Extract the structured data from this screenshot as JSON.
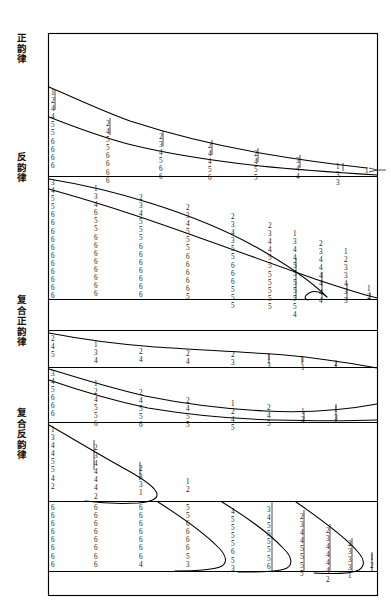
{
  "figure": {
    "title": "",
    "background": "#ffffff",
    "ink": "#000000",
    "panels": [
      {
        "id": "panel-1",
        "label": "正韵律",
        "columns": [
          {
            "x": 55,
            "digits": [
              "1",
              "2",
              "4",
              "4",
              "5",
              "5",
              "6",
              "6",
              "6",
              "6"
            ]
          },
          {
            "x": 110,
            "digits": [
              "2",
              "4",
              "5",
              "5",
              "6",
              "6",
              "6",
              "6"
            ]
          },
          {
            "x": 163,
            "digits": [
              "2",
              "3",
              "4",
              "5",
              "6",
              "6"
            ]
          },
          {
            "x": 212,
            "digits": [
              "2",
              "4",
              "4",
              "5",
              "6"
            ]
          },
          {
            "x": 258,
            "digits": [
              "2",
              "4",
              "5",
              "5"
            ]
          },
          {
            "x": 300,
            "digits": [
              "3",
              "4",
              "4"
            ]
          },
          {
            "x": 340,
            "digits": [
              "1",
              "3",
              "3"
            ]
          },
          {
            "x": 368,
            "digits": [
              "1"
            ]
          }
        ]
      },
      {
        "id": "panel-2",
        "label": "反韵律",
        "columns": [
          {
            "x": 55,
            "digits": [
              "3",
              "4",
              "5",
              "5",
              "6",
              "6",
              "6",
              "6",
              "6",
              "6",
              "6",
              "6",
              "6",
              "6",
              "6"
            ]
          },
          {
            "x": 98,
            "digits": [
              "1",
              "3",
              "4",
              "6",
              "5",
              "5",
              "6",
              "6",
              "6",
              "6",
              "6",
              "6",
              "6",
              "6"
            ]
          },
          {
            "x": 143,
            "digits": [
              "2",
              "3",
              "4",
              "5",
              "5",
              "5",
              "6",
              "6",
              "6",
              "6",
              "6",
              "6",
              "6"
            ]
          },
          {
            "x": 190,
            "digits": [
              "2",
              "3",
              "4",
              "5",
              "5",
              "5",
              "6",
              "6",
              "6",
              "6",
              "6",
              "5"
            ]
          },
          {
            "x": 235,
            "digits": [
              "2",
              "3",
              "4",
              "3",
              "5",
              "5",
              "6",
              "6",
              "6",
              "5",
              "5",
              "5"
            ]
          },
          {
            "x": 272,
            "digits": [
              "2",
              "3",
              "4",
              "4",
              "5",
              "5",
              "5",
              "5",
              "5",
              "5",
              "5"
            ]
          },
          {
            "x": 300,
            "digits": [
              "1",
              "3",
              "4",
              "4",
              "5",
              "5",
              "5",
              "5",
              "5",
              "5",
              "4"
            ]
          },
          {
            "x": 327,
            "digits": [
              "2",
              "3",
              "4",
              "4",
              "4",
              "4",
              "4",
              "4"
            ]
          },
          {
            "x": 348,
            "digits": [
              "1",
              "2",
              "3",
              "3",
              "4",
              "3",
              "3"
            ]
          },
          {
            "x": 371,
            "digits": [
              "1",
              "2"
            ]
          }
        ]
      },
      {
        "id": "panel-3",
        "label": "复合正韵律",
        "columns": [
          {
            "x": 55,
            "digits": [
              "2",
              "4",
              "5"
            ]
          },
          {
            "x": 98,
            "digits": [
              "1",
              "3",
              "4"
            ]
          },
          {
            "x": 143,
            "digits": [
              "2",
              "4"
            ]
          },
          {
            "x": 190,
            "digits": [
              "2",
              "4"
            ]
          },
          {
            "x": 235,
            "digits": [
              "2",
              "3"
            ]
          },
          {
            "x": 272,
            "digits": [
              "1",
              "3"
            ]
          },
          {
            "x": 305,
            "digits": [
              "1",
              "1"
            ]
          },
          {
            "x": 338,
            "digits": [
              "2"
            ]
          }
        ]
      },
      {
        "id": "panel-4",
        "label": "",
        "columns": [
          {
            "x": 55,
            "digits": [
              "3",
              "4",
              "5",
              "6",
              "6",
              "6"
            ]
          },
          {
            "x": 98,
            "digits": [
              "1",
              "2",
              "4",
              "5",
              "5",
              "6"
            ]
          },
          {
            "x": 143,
            "digits": [
              "2",
              "4",
              "5",
              "5",
              "6"
            ]
          },
          {
            "x": 190,
            "digits": [
              "2",
              "4",
              "5",
              "5"
            ]
          },
          {
            "x": 235,
            "digits": [
              "1",
              "2",
              "4",
              "5"
            ]
          },
          {
            "x": 272,
            "digits": [
              "2",
              "4",
              "5"
            ]
          },
          {
            "x": 305,
            "digits": [
              "1",
              "3"
            ]
          },
          {
            "x": 338,
            "digits": [
              "1",
              "3"
            ]
          }
        ]
      },
      {
        "id": "panel-5",
        "label": "复合反韵律",
        "columns": [
          {
            "x": 55,
            "digits": [
              "1",
              "3",
              "4",
              "4",
              "5",
              "5",
              "4",
              "2"
            ]
          },
          {
            "x": 98,
            "digits": [
              "2",
              "3",
              "4",
              "4",
              "4",
              "4",
              "2"
            ]
          },
          {
            "x": 143,
            "digits": [
              "2",
              "3",
              "3",
              "1"
            ]
          },
          {
            "x": 190,
            "digits": [
              "1",
              "2"
            ]
          }
        ]
      },
      {
        "id": "panel-6",
        "label": "",
        "columns": [
          {
            "x": 55,
            "digits": [
              "6",
              "6",
              "6",
              "6",
              "6",
              "6",
              "6",
              "6"
            ]
          },
          {
            "x": 98,
            "digits": [
              "6",
              "6",
              "6",
              "6",
              "6",
              "6",
              "6",
              "6"
            ]
          },
          {
            "x": 143,
            "digits": [
              "6",
              "6",
              "6",
              "6",
              "6",
              "6",
              "6",
              "4"
            ]
          },
          {
            "x": 190,
            "digits": [
              "5",
              "5",
              "6",
              "6",
              "6",
              "6",
              "5",
              "3"
            ]
          },
          {
            "x": 235,
            "digits": [
              "4",
              "5",
              "5",
              "5",
              "5",
              "6",
              "5",
              "3"
            ]
          },
          {
            "x": 272,
            "digits": [
              "3",
              "4",
              "5",
              "5",
              "5",
              "5",
              "5",
              "6"
            ]
          },
          {
            "x": 305,
            "digits": [
              "2",
              "3",
              "4",
              "4",
              "5",
              "5",
              "5",
              "5"
            ]
          },
          {
            "x": 330,
            "digits": [
              "2",
              "3",
              "4",
              "4",
              "4",
              "4",
              "2"
            ]
          },
          {
            "x": 352,
            "digits": [
              "2",
              "3",
              "3",
              "3",
              "1"
            ]
          },
          {
            "x": 374,
            "digits": [
              "1",
              "2"
            ]
          }
        ]
      }
    ]
  },
  "chart_data": {
    "type": "line",
    "xlabel": "",
    "ylabel": "",
    "grid": false,
    "legend_position": "left-outside",
    "series": [
      {
        "name": "正韵律-上曲线",
        "panel": "panel-1",
        "points": [
          [
            48,
            87
          ],
          [
            80,
            103
          ],
          [
            120,
            118
          ],
          [
            160,
            130
          ],
          [
            200,
            139
          ],
          [
            240,
            147
          ],
          [
            280,
            153
          ],
          [
            320,
            160
          ],
          [
            355,
            166
          ],
          [
            375,
            168
          ]
        ]
      },
      {
        "name": "正韵律-下曲线",
        "panel": "panel-1",
        "points": [
          [
            48,
            117
          ],
          [
            80,
            131
          ],
          [
            120,
            145
          ],
          [
            160,
            153
          ],
          [
            200,
            160
          ],
          [
            240,
            165
          ],
          [
            280,
            169
          ],
          [
            320,
            172
          ],
          [
            355,
            174
          ],
          [
            378,
            175
          ]
        ]
      },
      {
        "name": "反韵律-上曲线",
        "panel": "panel-2",
        "points": [
          [
            48,
            180
          ],
          [
            90,
            188
          ],
          [
            130,
            197
          ],
          [
            180,
            210
          ],
          [
            230,
            225
          ],
          [
            270,
            240
          ],
          [
            300,
            258
          ],
          [
            322,
            278
          ],
          [
            335,
            295
          ]
        ]
      },
      {
        "name": "反韵律-下曲线",
        "panel": "panel-2",
        "points": [
          [
            48,
            190
          ],
          [
            90,
            203
          ],
          [
            140,
            220
          ],
          [
            190,
            238
          ],
          [
            240,
            254
          ],
          [
            285,
            268
          ],
          [
            320,
            280
          ],
          [
            352,
            290
          ],
          [
            378,
            297
          ]
        ]
      },
      {
        "name": "复合正韵律-曲线",
        "panel": "panel-3",
        "points": [
          [
            48,
            334
          ],
          [
            90,
            342
          ],
          [
            140,
            347
          ],
          [
            190,
            349
          ],
          [
            240,
            351
          ],
          [
            280,
            353
          ],
          [
            320,
            358
          ],
          [
            355,
            366
          ],
          [
            378,
            369
          ]
        ]
      },
      {
        "name": "复合-中曲线-上",
        "panel": "panel-4",
        "points": [
          [
            48,
            371
          ],
          [
            90,
            381
          ],
          [
            140,
            391
          ],
          [
            190,
            399
          ],
          [
            235,
            404
          ],
          [
            272,
            407
          ],
          [
            310,
            409
          ],
          [
            345,
            408
          ],
          [
            372,
            404
          ]
        ]
      },
      {
        "name": "复合-中曲线-下",
        "panel": "panel-4",
        "points": [
          [
            48,
            381
          ],
          [
            90,
            392
          ],
          [
            140,
            402
          ],
          [
            190,
            410
          ],
          [
            235,
            415
          ],
          [
            272,
            418
          ],
          [
            310,
            420
          ],
          [
            345,
            420
          ],
          [
            378,
            419
          ]
        ]
      },
      {
        "name": "复合反韵律-回折曲线",
        "panel": "panel-5",
        "points": [
          [
            48,
            427
          ],
          [
            75,
            440
          ],
          [
            110,
            455
          ],
          [
            140,
            468
          ],
          [
            160,
            478
          ],
          [
            165,
            486
          ],
          [
            155,
            493
          ],
          [
            135,
            497
          ],
          [
            110,
            499
          ],
          [
            80,
            500
          ]
        ]
      },
      {
        "name": "底部曲线-1",
        "panel": "panel-6",
        "points": [
          [
            165,
            500
          ],
          [
            200,
            518
          ],
          [
            225,
            535
          ],
          [
            235,
            548
          ],
          [
            228,
            557
          ],
          [
            205,
            563
          ],
          [
            175,
            566
          ],
          [
            150,
            567
          ]
        ]
      },
      {
        "name": "底部曲线-2",
        "panel": "panel-6",
        "points": [
          [
            230,
            500
          ],
          [
            265,
            520
          ],
          [
            290,
            538
          ],
          [
            298,
            550
          ],
          [
            290,
            560
          ],
          [
            268,
            566
          ],
          [
            240,
            568
          ],
          [
            215,
            569
          ]
        ]
      },
      {
        "name": "底部曲线-3",
        "panel": "panel-6",
        "points": [
          [
            305,
            500
          ],
          [
            340,
            522
          ],
          [
            362,
            540
          ],
          [
            368,
            552
          ],
          [
            360,
            563
          ],
          [
            338,
            569
          ],
          [
            312,
            571
          ]
        ]
      }
    ],
    "digit_columns_note": "每条曲线下方的数字列为逐层节奏等级值 (1-6)"
  }
}
